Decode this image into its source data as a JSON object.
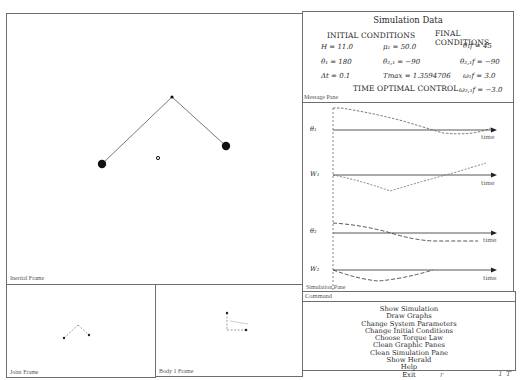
{
  "panes": {
    "inertial": {
      "label": "Inertial Frame"
    },
    "joint": {
      "label": "Joint Frame"
    },
    "body1": {
      "label": "Body 1 Frame"
    },
    "simulation_data": {
      "title": "Simulation Data",
      "initial_heading": "INITIAL CONDITIONS",
      "final_heading": "FINAL CONDITIONS",
      "control_heading": "TIME OPTIMAL CONTROL",
      "rows": [
        {
          "c1": "H = 11.0",
          "c2": "μ₁ = 50.0",
          "c3": "θ₁f = 45"
        },
        {
          "c1": "θ₁ = 180",
          "c2": "θ₂,₁ = −90",
          "c3": "θ₂,₁f = −90"
        },
        {
          "c1": "Δt = 0.1",
          "c2": "Tmax = 1.3594706",
          "c3": "ω₁f = 3.0"
        },
        {
          "c1": "",
          "c2": "",
          "c3": "ω₂,₁f = −3.0"
        }
      ]
    },
    "message": {
      "label": "Message Pane"
    },
    "simulation": {
      "label": "Simulation Pane",
      "graphs": [
        {
          "name": "θ₁",
          "axis_label": "time"
        },
        {
          "name": "W₁",
          "axis_label": "time"
        },
        {
          "name": "θ₂",
          "axis_label": "time"
        },
        {
          "name": "W₂",
          "axis_label": "time"
        }
      ]
    },
    "command": {
      "label": "Command",
      "items": [
        "Show Simulation",
        "Draw Graphs",
        "Change System Parameters",
        "Change Initial Conditions",
        "Choose Torque Law",
        "Clean Graphic Panes",
        "Clean Simulation Pane",
        "Show Herald",
        "Help",
        "Exit"
      ]
    }
  },
  "margin_marks": {
    "left": "r",
    "right": "1 T"
  },
  "colors": {
    "border": "#6e6e6e",
    "ink": "#2a2a2a",
    "mass": "#111111"
  }
}
